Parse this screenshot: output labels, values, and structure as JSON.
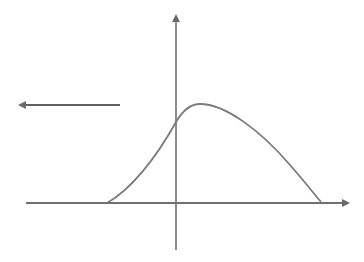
{
  "diagram": {
    "colors": {
      "background": "#ffffff",
      "axis": "#6e6e6e",
      "curve": "#7a7a7a",
      "arrow": "#5f5f5f"
    },
    "x_axis": {
      "x1": 26,
      "y": 203,
      "x2": 350
    },
    "y_axis": {
      "x": 176,
      "y_top": 14,
      "y_bottom": 250
    },
    "curve": {
      "start": [
        107,
        203
      ],
      "y_intercept": [
        176,
        122
      ],
      "peak": [
        200,
        104
      ],
      "end": [
        321,
        202
      ]
    },
    "left_arrow": {
      "x_start": 120,
      "x_end": 18,
      "y": 105
    },
    "labels": []
  }
}
